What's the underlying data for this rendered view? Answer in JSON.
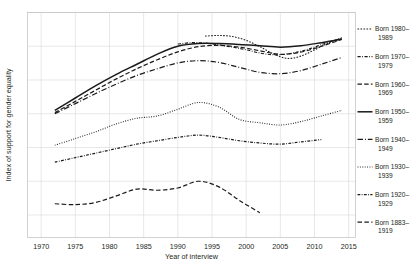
{
  "chart_data": {
    "type": "line",
    "title": "",
    "xlabel": "Year of interview",
    "ylabel": "Index of support for gender equality",
    "xlim": [
      1968,
      2016
    ],
    "ylim": [
      0,
      100
    ],
    "xticks": [
      1970,
      1975,
      1980,
      1985,
      1990,
      1995,
      2000,
      2005,
      2010,
      2015
    ],
    "xtick_labels": [
      "1970",
      "1975",
      "1980",
      "1985",
      "1990",
      "1995",
      "2000",
      "2005",
      "2010",
      "2015"
    ],
    "yticks": [
      10,
      25,
      40,
      55,
      70,
      85,
      100
    ],
    "ytick_labels": [
      "",
      "",
      "",
      "",
      "",
      "",
      ""
    ],
    "grid": true,
    "legend_position": "right",
    "series": [
      {
        "name": "Born 1980–\n1989",
        "label_line1": "Born 1980–",
        "label_line2": "1989",
        "dash": "1.6 1.4",
        "width": 1.1,
        "color": "#1a1a1a",
        "x": [
          1994,
          1996,
          1998,
          2000,
          2002,
          2004,
          2006,
          2008,
          2010,
          2012,
          2014
        ],
        "y": [
          89.5,
          89.8,
          89.3,
          87.6,
          84.8,
          81.6,
          79.6,
          80.6,
          83.4,
          86.4,
          88.8
        ]
      },
      {
        "name": "Born 1970–\n1979",
        "label_line1": "Born 1970–",
        "label_line2": "1979",
        "dash": "3.2 1.5 0.8 1.5",
        "width": 1.1,
        "color": "#1a1a1a",
        "x": [
          1990,
          1992,
          1994,
          1996,
          1998,
          2000,
          2002,
          2004,
          2006,
          2008,
          2010,
          2012,
          2014
        ],
        "y": [
          86.0,
          86.6,
          86.4,
          85.6,
          84.6,
          83.4,
          82.0,
          81.2,
          81.6,
          82.8,
          84.6,
          86.8,
          88.4
        ]
      },
      {
        "name": "Born 1960–\n1969",
        "label_line1": "Born 1960–",
        "label_line2": "1969",
        "dash": "4.5 2.2",
        "width": 1.2,
        "color": "#1a1a1a",
        "x": [
          1972,
          1975,
          1978,
          1981,
          1984,
          1987,
          1990,
          1993,
          1996,
          1999,
          2002,
          2005,
          2008,
          2011,
          2014
        ],
        "y": [
          55.5,
          60.5,
          65.5,
          70.5,
          75.0,
          79.0,
          82.5,
          84.8,
          85.4,
          84.6,
          83.0,
          81.4,
          82.4,
          85.0,
          88.0
        ]
      },
      {
        "name": "Born 1950–\n1959",
        "label_line1": "Born 1950–",
        "label_line2": "1959",
        "dash": "none",
        "width": 1.5,
        "color": "#1a1a1a",
        "x": [
          1972,
          1975,
          1978,
          1981,
          1984,
          1987,
          1990,
          1993,
          1996,
          1999,
          2002,
          2005,
          2008,
          2011,
          2014
        ],
        "y": [
          56.5,
          62.0,
          67.5,
          72.5,
          77.0,
          81.5,
          85.0,
          86.2,
          86.2,
          85.8,
          85.2,
          84.6,
          85.2,
          86.6,
          88.2
        ]
      },
      {
        "name": "Born 1940–\n1949",
        "label_line1": "Born 1940–",
        "label_line2": "1949",
        "dash": "5.5 2 0.9 2",
        "width": 1.2,
        "color": "#1a1a1a",
        "x": [
          1972,
          1975,
          1978,
          1981,
          1984,
          1987,
          1990,
          1993,
          1996,
          1999,
          2002,
          2005,
          2008,
          2011,
          2014
        ],
        "y": [
          55.0,
          59.5,
          64.0,
          68.2,
          72.0,
          75.0,
          77.6,
          78.6,
          77.8,
          75.6,
          73.4,
          72.8,
          74.2,
          77.0,
          80.0
        ]
      },
      {
        "name": "Born 1930–\n1939",
        "label_line1": "Born 1930–",
        "label_line2": "1939",
        "dash": "0.9 1.5",
        "width": 1.1,
        "color": "#1a1a1a",
        "x": [
          1972,
          1975,
          1978,
          1981,
          1984,
          1987,
          1990,
          1993,
          1996,
          1999,
          2002,
          2005,
          2008,
          2011,
          2014
        ],
        "y": [
          41.0,
          44.0,
          47.0,
          50.5,
          53.0,
          54.0,
          57.0,
          60.0,
          58.0,
          52.5,
          51.0,
          50.0,
          51.5,
          54.0,
          56.5
        ]
      },
      {
        "name": "Born 1920–\n1929",
        "label_line1": "Born 1920–",
        "label_line2": "1929",
        "dash": "2.8 1.4 0.8 1.4",
        "width": 1.2,
        "color": "#1a1a1a",
        "x": [
          1972,
          1975,
          1978,
          1981,
          1984,
          1987,
          1990,
          1993,
          1996,
          1999,
          2002,
          2005,
          2008,
          2011
        ],
        "y": [
          33.5,
          35.5,
          37.5,
          39.5,
          41.5,
          43.0,
          44.5,
          45.5,
          44.5,
          43.0,
          42.0,
          41.5,
          42.5,
          43.5
        ]
      },
      {
        "name": "Born 1883–\n1919",
        "label_line1": "Born 1883–",
        "label_line2": "1919",
        "dash": "4.5 2.4",
        "width": 1.2,
        "color": "#1a1a1a",
        "x": [
          1972,
          1975,
          1978,
          1981,
          1984,
          1987,
          1990,
          1993,
          1996,
          1999,
          2002
        ],
        "y": [
          15.0,
          14.6,
          15.6,
          18.5,
          21.5,
          21.0,
          22.0,
          25.0,
          22.5,
          16.5,
          11.0
        ]
      }
    ]
  },
  "axis": {
    "x_title": "Year of interview",
    "y_title": "Index of support for gender equality"
  }
}
